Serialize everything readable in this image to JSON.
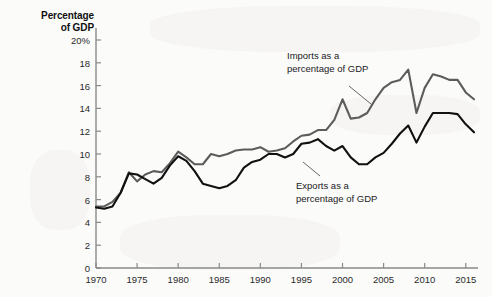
{
  "chart_data": {
    "type": "line",
    "title": "Percentage of GDP",
    "xlabel": "",
    "ylabel": "Percentage of GDP",
    "ylim": [
      0,
      20
    ],
    "xlim": [
      1970,
      2016
    ],
    "grid": false,
    "legend_position": "inline-annotations",
    "y_ticks": [
      "0",
      "2",
      "4",
      "6",
      "8",
      "10",
      "12",
      "14",
      "16",
      "18",
      "20%"
    ],
    "y_tick_values": [
      0,
      2,
      4,
      6,
      8,
      10,
      12,
      14,
      16,
      18,
      20
    ],
    "x_ticks": [
      "1970",
      "1975",
      "1980",
      "1985",
      "1990",
      "1995",
      "2000",
      "2005",
      "2010",
      "2015"
    ],
    "x_tick_values": [
      1970,
      1975,
      1980,
      1985,
      1990,
      1995,
      2000,
      2005,
      2010,
      2015
    ],
    "x": [
      1970,
      1971,
      1972,
      1973,
      1974,
      1975,
      1976,
      1977,
      1978,
      1979,
      1980,
      1981,
      1982,
      1983,
      1984,
      1985,
      1986,
      1987,
      1988,
      1989,
      1990,
      1991,
      1992,
      1993,
      1994,
      1995,
      1996,
      1997,
      1998,
      1999,
      2000,
      2001,
      2002,
      2003,
      2004,
      2005,
      2006,
      2007,
      2008,
      2009,
      2010,
      2011,
      2012,
      2013,
      2014,
      2015,
      2016
    ],
    "series": [
      {
        "name": "Imports as a percentage of GDP",
        "color": "#5c5c5c",
        "values": [
          5.4,
          5.4,
          5.8,
          6.6,
          8.4,
          7.6,
          8.2,
          8.5,
          8.4,
          9.2,
          10.2,
          9.7,
          9.1,
          9.1,
          10.0,
          9.8,
          10.0,
          10.3,
          10.4,
          10.4,
          10.6,
          10.2,
          10.3,
          10.5,
          11.1,
          11.6,
          11.7,
          12.1,
          12.1,
          13.0,
          14.8,
          13.1,
          13.2,
          13.6,
          14.8,
          15.8,
          16.3,
          16.5,
          17.4,
          13.6,
          15.8,
          17.0,
          16.8,
          16.5,
          16.5,
          15.4,
          14.8
        ]
      },
      {
        "name": "Exports as a percentage of GDP",
        "color": "#111111",
        "values": [
          5.3,
          5.2,
          5.4,
          6.6,
          8.3,
          8.2,
          7.8,
          7.4,
          7.9,
          9.0,
          9.8,
          9.4,
          8.5,
          7.4,
          7.2,
          7.0,
          7.2,
          7.7,
          8.8,
          9.3,
          9.5,
          10.0,
          10.0,
          9.7,
          10.0,
          10.9,
          11.0,
          11.3,
          10.7,
          10.3,
          10.7,
          9.7,
          9.1,
          9.1,
          9.7,
          10.1,
          10.9,
          11.8,
          12.5,
          11.0,
          12.4,
          13.6,
          13.6,
          13.6,
          13.5,
          12.6,
          11.9
        ]
      }
    ],
    "annotations": [
      {
        "id": "imports-label",
        "text": "Imports as a\npercentage of GDP",
        "x_px": 287,
        "y_px": 50,
        "leader_from": [
          349,
          86
        ],
        "leader_to": [
          371,
          104
        ]
      },
      {
        "id": "exports-label",
        "text": "Exports as a\npercentage of GDP",
        "x_px": 296,
        "y_px": 180,
        "leader_from": [
          320,
          176
        ],
        "leader_to": [
          303,
          162
        ]
      }
    ]
  },
  "axis": {
    "y_axis_title_line1": "Percentage",
    "y_axis_title_line2": "of GDP"
  }
}
